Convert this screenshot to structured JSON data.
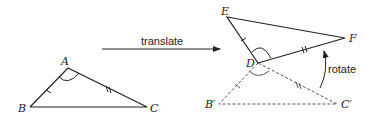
{
  "figure": {
    "original_triangle": {
      "vertices": {
        "A": "A",
        "B": "B",
        "C": "C"
      }
    },
    "transform_arrow": {
      "label": "translate"
    },
    "image_triangle": {
      "vertices": {
        "D": "D",
        "E": "E",
        "F": "F"
      }
    },
    "translated_triangle": {
      "vertices": {
        "B_prime": "B′",
        "C_prime": "C′"
      }
    },
    "rotate_arrow": {
      "label": "rotate"
    },
    "colors": {
      "stroke": "#222222",
      "dashed": "#555555",
      "background": "#ffffff"
    }
  }
}
